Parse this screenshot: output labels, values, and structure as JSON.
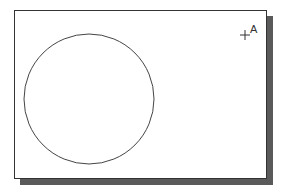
{
  "diagram": {
    "point_label": "A",
    "colors": {
      "frame": "#333333",
      "shadow": "#5a5a5a",
      "circle": "#444444"
    },
    "circle": {
      "cx": 89,
      "cy": 99,
      "r": 65
    },
    "point": {
      "x": 245,
      "y": 35
    }
  }
}
